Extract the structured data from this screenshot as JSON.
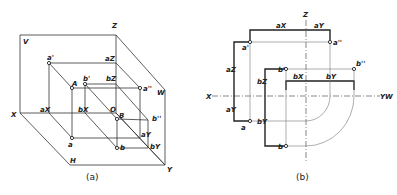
{
  "figure_a": {
    "caption": "(a)",
    "labels": {
      "V": "V",
      "Z": "Z",
      "W": "W",
      "X": "X",
      "H": "H",
      "Y": "Y",
      "O": "O",
      "a_prime": "a'",
      "a_z": "aZ",
      "A": "A",
      "a_dprime": "a''",
      "b_prime": "b'",
      "b_z": "bZ",
      "a_x": "aX",
      "b_x": "bX",
      "B": "B",
      "b_dprime": "b''",
      "a": "a",
      "a_y": "aY",
      "b": "b",
      "b_y": "bY"
    }
  },
  "figure_b": {
    "caption": "(b)",
    "labels": {
      "Z": "Z",
      "X": "X",
      "Y_W": "YW",
      "a_x": "aX",
      "a_y": "aY",
      "a_prime": "a'",
      "a_dprime": "a''",
      "a_z": "aZ",
      "a_y2": "aY",
      "a": "a",
      "b_prime": "b'",
      "b_dprime": "b''",
      "b_x": "bX",
      "b_y": "bY",
      "b_z": "bZ",
      "b_y2": "bY",
      "b": "b"
    }
  }
}
